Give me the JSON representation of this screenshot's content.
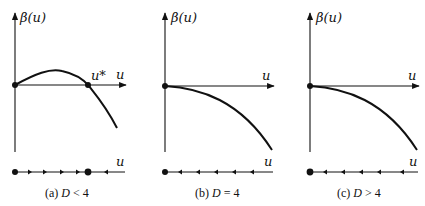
{
  "figure": {
    "panels": [
      {
        "id": "a",
        "caption_prefix": "(a) ",
        "caption_var": "D",
        "caption_rel": " < 4",
        "y_axis_label": "β(u)",
        "x_axis_label": "u",
        "phase_axis_label": "u",
        "fixed_point_label": "u*",
        "curve": "rises from 0, peaks, crosses zero at u*, then decreases",
        "fixed_points": [
          "0 (unstable)",
          "u* (stable)"
        ],
        "flow": "right on (0,u*), left for u>u*"
      },
      {
        "id": "b",
        "caption_prefix": "(b) ",
        "caption_var": "D",
        "caption_rel": " = 4",
        "y_axis_label": "β(u)",
        "x_axis_label": "u",
        "phase_axis_label": "u",
        "curve": "starts at 0 with zero slope and decreases",
        "fixed_points": [
          "0 (stable)"
        ],
        "flow": "left for u>0"
      },
      {
        "id": "c",
        "caption_prefix": "(c) ",
        "caption_var": "D",
        "caption_rel": " > 4",
        "y_axis_label": "β(u)",
        "x_axis_label": "u",
        "phase_axis_label": "u",
        "curve": "starts at 0 and decreases",
        "fixed_points": [
          "0 (stable)"
        ],
        "flow": "left for u>0"
      }
    ],
    "colors": {
      "ink": "#111111",
      "background": "#ffffff"
    }
  }
}
